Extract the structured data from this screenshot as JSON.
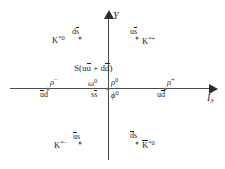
{
  "diagram": {
    "axes": {
      "y_label": "Y",
      "x_label_main": "I",
      "x_label_sub": "3"
    },
    "center_state": {
      "text_prefix": "S(u",
      "text_u_bar": "u",
      "text_plus": " + d",
      "text_d_bar": "d",
      "text_suffix": ")",
      "full": "S(uu̅ + dd̅)"
    },
    "states": [
      {
        "id": "k-star-0",
        "particle_base": "K",
        "particle_sup": "*0",
        "quark_left": "d",
        "quark_overline": "s",
        "x": 80,
        "y": 38
      },
      {
        "id": "k-star-plus",
        "particle_base": "K",
        "particle_sup": "*+",
        "quark_left": "u",
        "quark_overline": "s",
        "x": 137,
        "y": 38
      },
      {
        "id": "rho-minus",
        "particle_base": "ρ",
        "particle_sup": "−",
        "quark_left": "d",
        "quark_overline": "u",
        "quark_display": "u̅d",
        "x": 48,
        "y": 88
      },
      {
        "id": "rho-zero",
        "particle_base": "ρ",
        "particle_sup": "0",
        "quark_left": "",
        "quark_overline": "",
        "x": 108,
        "y": 88
      },
      {
        "id": "omega-zero",
        "particle_base": "ω",
        "particle_sup": "0",
        "quark_left": "s",
        "quark_overline": "s",
        "quark_display": "ss̅",
        "x": 108,
        "y": 88
      },
      {
        "id": "phi-zero",
        "particle_base": "ϕ",
        "particle_sup": "0",
        "quark_left": "",
        "quark_overline": "",
        "x": 108,
        "y": 88
      },
      {
        "id": "rho-plus",
        "particle_base": "ρ",
        "particle_sup": "+",
        "quark_left": "u",
        "quark_overline": "d",
        "quark_display": "ud̅",
        "x": 165,
        "y": 88
      },
      {
        "id": "k-star-minus",
        "particle_base": "K",
        "particle_sup": "*−",
        "quark_left": "s",
        "quark_overline": "u",
        "quark_display": "u̅s",
        "x": 80,
        "y": 143
      },
      {
        "id": "k-star-0-bar",
        "particle_base": "K",
        "particle_sup": "*0",
        "quark_left": "s",
        "quark_overline": "d",
        "quark_display": "d̅s",
        "x": 137,
        "y": 143
      }
    ],
    "labels": {
      "k_star_0_particle": "K",
      "k_star_0_sup": "*0",
      "k_star_0_quark_bar": "s",
      "k_star_0_quark_pre": "d",
      "k_star_plus_particle": "K",
      "k_star_plus_sup": "*+",
      "k_star_plus_quark_pre": "u",
      "k_star_plus_quark_bar": "s",
      "rho_minus_symbol": "ρ",
      "rho_minus_sup": "−",
      "rho_minus_quark_bar": "u",
      "rho_minus_quark_post": "d",
      "omega_symbol": "ω",
      "omega_sup": "0",
      "omega_quark_pre": "s",
      "omega_quark_bar": "s",
      "rho_zero_symbol": "ρ",
      "rho_zero_sup": "0",
      "phi_symbol": "ϕ",
      "phi_sup": "0",
      "rho_plus_symbol": "ρ",
      "rho_plus_sup": "+",
      "rho_plus_quark_pre": "u",
      "rho_plus_quark_bar": "d",
      "k_star_minus_particle": "K",
      "k_star_minus_sup": "*−",
      "k_star_minus_quark_bar": "u",
      "k_star_minus_quark_post": "s",
      "k_star_0_bar_particle": "K",
      "k_star_0_bar_sup": "*0",
      "k_star_0_bar_quark_bar": "d",
      "k_star_0_bar_quark_post": "s"
    },
    "colors": {
      "background": "#ffffff",
      "axis": "#4a4a4a",
      "point": "#6b6b6b",
      "text": "#1f1f1f"
    }
  }
}
